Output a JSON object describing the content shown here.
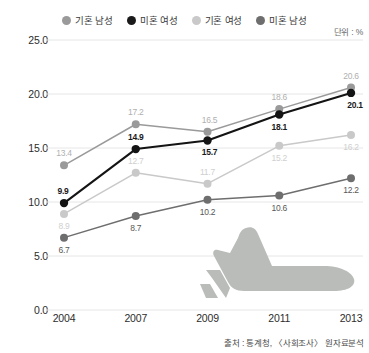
{
  "unit_note": "단위 : %",
  "source_note": "출처 : 통계청, 〈사회조사〉 원자료분석",
  "legend": {
    "entries": [
      {
        "label": "기혼 남성",
        "color": "#9a9a9a"
      },
      {
        "label": "미혼 여성",
        "color": "#1a1a1a"
      },
      {
        "label": "기혼 여성",
        "color": "#c9c9c9"
      },
      {
        "label": "미혼 남성",
        "color": "#6e6e6e"
      }
    ]
  },
  "chart_data": {
    "type": "line",
    "title": "",
    "xlabel": "",
    "ylabel": "",
    "unit": "%",
    "categories": [
      "2004",
      "2007",
      "2009",
      "2011",
      "2013"
    ],
    "ylim": [
      0.0,
      25.0
    ],
    "yticks": [
      "0.0",
      "5.0",
      "10.0",
      "15.0",
      "20.0",
      "25.0"
    ],
    "ytick_values": [
      0.0,
      5.0,
      10.0,
      15.0,
      20.0,
      25.0
    ],
    "grid": true,
    "legend_position": "top",
    "series": [
      {
        "name": "기혼 남성",
        "color": "#9a9a9a",
        "label_color": "#b0b0b0",
        "values": [
          13.4,
          17.2,
          16.5,
          18.6,
          20.6
        ],
        "label_offsets": [
          {
            "dx": 0,
            "dy": -12
          },
          {
            "dx": 0,
            "dy": -12
          },
          {
            "dx": 2,
            "dy": -12
          },
          {
            "dx": 0,
            "dy": -12
          },
          {
            "dx": 0,
            "dy": -12
          }
        ]
      },
      {
        "name": "미혼 여성",
        "color": "#141414",
        "label_color": "#1a1a1a",
        "values": [
          9.9,
          14.9,
          15.7,
          18.1,
          20.1
        ],
        "label_offsets": [
          {
            "dx": -1,
            "dy": -12
          },
          {
            "dx": 0,
            "dy": -12
          },
          {
            "dx": 2,
            "dy": 12
          },
          {
            "dx": 0,
            "dy": 12
          },
          {
            "dx": 4,
            "dy": 12
          }
        ]
      },
      {
        "name": "기혼 여성",
        "color": "#c9c9c9",
        "label_color": "#cfcfcf",
        "values": [
          8.9,
          12.7,
          11.7,
          15.2,
          16.2
        ],
        "label_offsets": [
          {
            "dx": 0,
            "dy": 12
          },
          {
            "dx": 0,
            "dy": -12
          },
          {
            "dx": 0,
            "dy": -12
          },
          {
            "dx": 0,
            "dy": 12
          },
          {
            "dx": 0,
            "dy": 12
          }
        ]
      },
      {
        "name": "미혼 남성",
        "color": "#6e6e6e",
        "label_color": "#585858",
        "values": [
          6.7,
          8.7,
          10.2,
          10.6,
          12.2
        ],
        "label_offsets": [
          {
            "dx": 0,
            "dy": 12
          },
          {
            "dx": 0,
            "dy": 12
          },
          {
            "dx": 0,
            "dy": 12
          },
          {
            "dx": 0,
            "dy": 12
          },
          {
            "dx": 0,
            "dy": 12
          }
        ]
      }
    ]
  }
}
